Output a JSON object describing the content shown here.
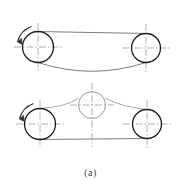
{
  "figure": {
    "caption": "(a)",
    "colors": {
      "pulley_stroke": "#1d1d1d",
      "idler_stroke": "#9a9a9a",
      "belt_stroke": "#6e6e6e",
      "centerline_stroke": "#8c8c8c",
      "arrow_stroke": "#2a2a2a",
      "background": "#ffffff"
    },
    "diagrams": [
      {
        "name": "belt-drive-without-tensioner",
        "label": "upper-belt-drive",
        "pulleys": [
          {
            "name": "driver-pulley",
            "cx": 38,
            "cy": 47,
            "r": 15.5,
            "role": "driver"
          },
          {
            "name": "driven-pulley",
            "cx": 146,
            "cy": 48,
            "r": 14.5,
            "role": "driven"
          }
        ],
        "belt_spans": [
          {
            "name": "taut-span-top",
            "type": "straight",
            "x1": 38,
            "y1": 31.5,
            "x2": 146,
            "y2": 33.5
          },
          {
            "name": "slack-span-bottom",
            "type": "curve",
            "x1": 38,
            "y1": 62.5,
            "cx": 92,
            "cy": 74,
            "x2": 146,
            "y2": 62.5
          }
        ],
        "rotation_arrow": {
          "name": "rotation-arrow-ccw",
          "direction": "counterclockwise",
          "cx": 38,
          "cy": 47,
          "r": 22,
          "start_deg": 200,
          "end_deg": 262
        },
        "centerlines": [
          {
            "name": "centerline-vertical-driver",
            "orientation": "vertical",
            "x": 38,
            "y1": 23,
            "y2": 71
          },
          {
            "name": "centerline-horizontal-driver",
            "orientation": "horizontal",
            "y": 47,
            "x1": 14,
            "x2": 62
          },
          {
            "name": "centerline-vertical-driven",
            "orientation": "vertical",
            "x": 146,
            "y1": 24,
            "y2": 72
          },
          {
            "name": "centerline-horizontal-driven",
            "orientation": "horizontal",
            "y": 48,
            "x1": 122,
            "x2": 170
          }
        ]
      },
      {
        "name": "belt-drive-with-tensioner",
        "label": "lower-belt-drive",
        "pulleys": [
          {
            "name": "driver-pulley",
            "cx": 40,
            "cy": 124,
            "r": 15.5,
            "role": "driver"
          },
          {
            "name": "driven-pulley",
            "cx": 147,
            "cy": 124,
            "r": 14.5,
            "role": "driven"
          }
        ],
        "idler": {
          "name": "tensioner-idler-pulley",
          "cx": 92,
          "cy": 105,
          "r": 13.5,
          "role": "tensioner"
        },
        "belt_spans": [
          {
            "name": "taut-span-bottom",
            "type": "straight",
            "x1": 40,
            "y1": 139.5,
            "x2": 147,
            "y2": 138.5
          },
          {
            "name": "belt-over-idler-left",
            "type": "curve",
            "x1": 40,
            "y1": 108.5,
            "cx": 66,
            "cy": 105,
            "x2": 79,
            "y2": 99
          },
          {
            "name": "belt-over-idler-right",
            "type": "curve",
            "x1": 105,
            "y1": 99,
            "cx": 122,
            "cy": 105,
            "x2": 147,
            "y2": 109.5
          }
        ],
        "rotation_arrow": {
          "name": "rotation-arrow-ccw",
          "direction": "counterclockwise",
          "cx": 40,
          "cy": 124,
          "r": 22,
          "start_deg": 200,
          "end_deg": 262
        },
        "centerlines": [
          {
            "name": "centerline-vertical-driver",
            "orientation": "vertical",
            "x": 40,
            "y1": 100,
            "y2": 148
          },
          {
            "name": "centerline-horizontal-driver",
            "orientation": "horizontal",
            "y": 124,
            "x1": 16,
            "x2": 64
          },
          {
            "name": "centerline-vertical-idler",
            "orientation": "vertical",
            "x": 92,
            "y1": 83,
            "y2": 147
          },
          {
            "name": "centerline-horizontal-idler",
            "orientation": "horizontal",
            "y": 105,
            "x1": 70,
            "x2": 114
          },
          {
            "name": "centerline-vertical-driven",
            "orientation": "vertical",
            "x": 147,
            "y1": 100,
            "y2": 148
          },
          {
            "name": "centerline-horizontal-driven",
            "orientation": "horizontal",
            "y": 124,
            "x1": 123,
            "x2": 171
          }
        ]
      }
    ]
  }
}
